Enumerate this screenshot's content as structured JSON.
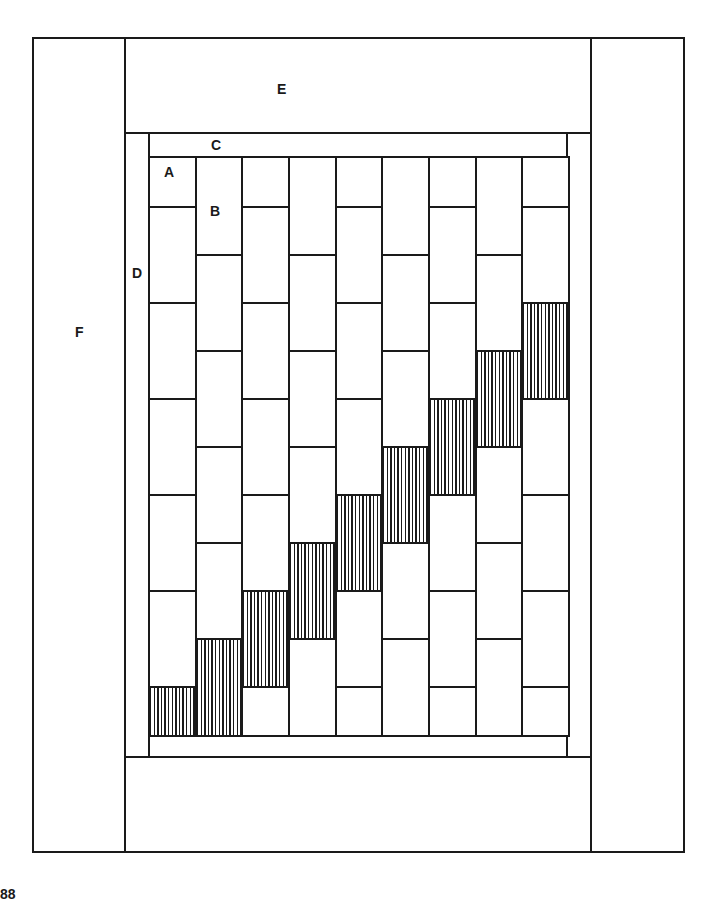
{
  "diagram": {
    "labels": {
      "A": "A",
      "B": "B",
      "C": "C",
      "D": "D",
      "E": "E",
      "F": "F"
    },
    "page_number_fragment": "88",
    "colors": {
      "line": "#1a1a1a",
      "background": "#ffffff",
      "hatch": "#1a1a1a"
    },
    "frame": {
      "outer": {
        "x": 32,
        "y": 37,
        "w": 653,
        "h": 816
      },
      "border_F_left": {
        "x": 32,
        "y": 37,
        "w": 94,
        "h": 816
      },
      "border_F_right": {
        "x": 590,
        "y": 37,
        "w": 95,
        "h": 816
      },
      "border_E_top": {
        "x": 124,
        "y": 37,
        "w": 468,
        "h": 97
      },
      "border_E_bottom": {
        "x": 124,
        "y": 756,
        "w": 468,
        "h": 97
      },
      "strip_D_left": {
        "x": 124,
        "y": 132,
        "w": 26,
        "h": 626
      },
      "strip_D_right": {
        "x": 566,
        "y": 132,
        "w": 26,
        "h": 626
      },
      "strip_C_top": {
        "x": 148,
        "y": 132,
        "w": 420,
        "h": 26
      },
      "strip_C_bottom": {
        "x": 148,
        "y": 733,
        "w": 420,
        "h": 25
      }
    },
    "grid": {
      "x": 148,
      "y": 156,
      "right": 568,
      "bottom": 735,
      "columns": 9,
      "full_block_height": 96,
      "half_block_height": 48,
      "column_pattern": "odd columns start with half block (A); even columns start with full block (B)",
      "hatched_blocks": [
        {
          "column": 1,
          "y_start": 686,
          "y_end": 735,
          "type": "half"
        },
        {
          "column": 2,
          "y_start": 638,
          "y_end": 735,
          "type": "full"
        },
        {
          "column": 3,
          "y_start": 590,
          "y_end": 686,
          "type": "full"
        },
        {
          "column": 4,
          "y_start": 542,
          "y_end": 638,
          "type": "full"
        },
        {
          "column": 5,
          "y_start": 494,
          "y_end": 590,
          "type": "full"
        },
        {
          "column": 6,
          "y_start": 446,
          "y_end": 542,
          "type": "full"
        },
        {
          "column": 7,
          "y_start": 398,
          "y_end": 494,
          "type": "full"
        },
        {
          "column": 8,
          "y_start": 350,
          "y_end": 446,
          "type": "full"
        },
        {
          "column": 9,
          "y_start": 302,
          "y_end": 398,
          "type": "full"
        }
      ]
    },
    "label_positions": {
      "A": {
        "x": 164,
        "y": 165
      },
      "B": {
        "x": 210,
        "y": 204
      },
      "C": {
        "x": 211,
        "y": 138
      },
      "D": {
        "x": 132,
        "y": 266
      },
      "E": {
        "x": 277,
        "y": 82
      },
      "F": {
        "x": 75,
        "y": 325
      }
    }
  }
}
